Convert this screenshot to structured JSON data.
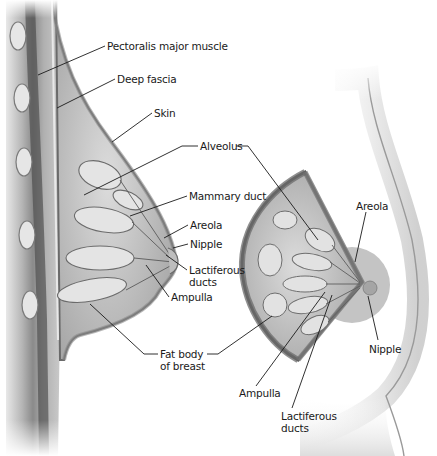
{
  "colors": {
    "background": "#ffffff",
    "tissue_light": "#d6d6d6",
    "tissue_mid": "#a9a9a9",
    "tissue_dark": "#5e5e5e",
    "muscle_dark": "#3f3f3f",
    "skin_shade": "#c8c8c8",
    "areola_inset": "#bdbdbd",
    "leader_line": "#1a1a1a",
    "text": "#1a1a1a"
  },
  "left_section": {
    "description": "Sagittal section of breast on chest wall",
    "labels": [
      {
        "id": "pectoralis",
        "text": "Pectoralis major muscle",
        "x": 107,
        "y": 40
      },
      {
        "id": "deep-fascia",
        "text": "Deep fascia",
        "x": 117,
        "y": 73
      },
      {
        "id": "skin",
        "text": "Skin",
        "x": 154,
        "y": 107
      },
      {
        "id": "alveolus",
        "text": "Alveolus",
        "x": 200,
        "y": 141
      },
      {
        "id": "mammary-duct",
        "text": "Mammary duct",
        "x": 189,
        "y": 190
      },
      {
        "id": "areola",
        "text": "Areola",
        "x": 190,
        "y": 219
      },
      {
        "id": "nipple",
        "text": "Nipple",
        "x": 190,
        "y": 238
      },
      {
        "id": "lactiferous-ducts-line1",
        "text": "Lactiferous",
        "x": 189,
        "y": 268
      },
      {
        "id": "lactiferous-ducts-line2",
        "text": "ducts",
        "x": 189,
        "y": 280
      },
      {
        "id": "ampulla",
        "text": "Ampulla",
        "x": 171,
        "y": 291
      },
      {
        "id": "fat-body-line1",
        "text": "Fat body",
        "x": 160,
        "y": 348
      },
      {
        "id": "fat-body-line2",
        "text": "of breast",
        "x": 160,
        "y": 361
      }
    ]
  },
  "right_view": {
    "description": "Anterior view of breast with cutaway wedge",
    "labels": [
      {
        "id": "areola-right",
        "text": "Areola",
        "x": 356,
        "y": 200
      },
      {
        "id": "nipple-right",
        "text": "Nipple",
        "x": 369,
        "y": 346
      },
      {
        "id": "ampulla-right",
        "text": "Ampulla",
        "x": 239,
        "y": 390
      },
      {
        "id": "lactiferous-right-line1",
        "text": "Lactiferous",
        "x": 281,
        "y": 412
      },
      {
        "id": "lactiferous-right-line2",
        "text": "ducts",
        "x": 281,
        "y": 424
      }
    ]
  }
}
